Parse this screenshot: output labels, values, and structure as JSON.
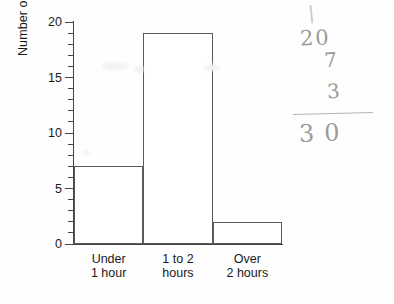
{
  "chart_data": {
    "type": "bar",
    "title": "",
    "xlabel": "",
    "ylabel": "Number of pupils",
    "categories": [
      "Under\n1 hour",
      "1 to 2\nhours",
      "Over\n2 hours"
    ],
    "values": [
      7,
      19,
      2
    ],
    "ylim": [
      0,
      20
    ],
    "y_tick_labels": [
      "0",
      "5",
      "10",
      "15",
      "20"
    ],
    "y_major_step": 5,
    "y_minor_step": 1,
    "grid": false,
    "legend": null,
    "bar_style": "adjacent-outlined",
    "bar_fill_color": "#ffffff",
    "bar_outline_color": "#5a5a5a",
    "axis_color": "#444444"
  },
  "handwriting": {
    "stray_mark": "\\",
    "addend_1": "20",
    "addend_2": "7",
    "addend_3": "3",
    "total": "30",
    "pencil_color": "#9b9b9b"
  }
}
